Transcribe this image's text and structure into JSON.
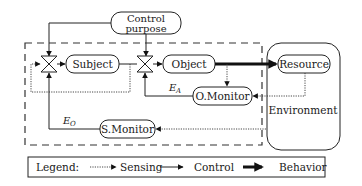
{
  "diagram": {
    "nodes": {
      "control_purpose": {
        "line1": "Control",
        "line2": "purpose"
      },
      "subject": {
        "label": "Subject"
      },
      "object": {
        "label": "Object"
      },
      "resource": {
        "label": "Resource"
      },
      "o_monitor": {
        "label": "O.Monitor"
      },
      "s_monitor": {
        "label": "S.Monitor"
      },
      "environment": {
        "label": "Environment"
      }
    },
    "edge_labels": {
      "e_a": {
        "main": "E",
        "sub": "A"
      },
      "e_o": {
        "main": "E",
        "sub": "O"
      }
    },
    "legend": {
      "title": "Legend:",
      "items": [
        {
          "label": "Sensing",
          "style": "dotted"
        },
        {
          "label": "Control",
          "style": "thin-solid"
        },
        {
          "label": "Behavior",
          "style": "thick-solid"
        }
      ]
    },
    "edges": [
      {
        "from": "control_purpose",
        "to": "valve_1",
        "type": "control"
      },
      {
        "from": "control_purpose",
        "to": "valve_2",
        "type": "control"
      },
      {
        "from": "valve_1",
        "to": "subject",
        "type": "control"
      },
      {
        "from": "subject",
        "to": "valve_2",
        "type": "control"
      },
      {
        "from": "valve_2",
        "to": "object",
        "type": "control"
      },
      {
        "from": "object",
        "to": "resource",
        "type": "behavior"
      },
      {
        "from": "object",
        "to": "o_monitor",
        "type": "sensing"
      },
      {
        "from": "resource",
        "to": "o_monitor",
        "type": "sensing"
      },
      {
        "from": "o_monitor",
        "to": "valve_2",
        "type": "control",
        "label": "E_A"
      },
      {
        "from": "environment",
        "to": "s_monitor",
        "type": "sensing"
      },
      {
        "from": "s_monitor",
        "to": "valve_1",
        "type": "control",
        "label": "E_O"
      },
      {
        "from": "valve_2",
        "to": "valve_1",
        "type": "sensing"
      }
    ]
  }
}
